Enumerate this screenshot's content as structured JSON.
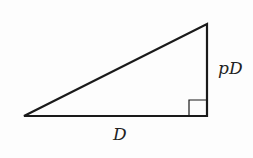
{
  "diagram": {
    "type": "right-triangle",
    "labels": {
      "base": "D",
      "height": "pD"
    },
    "vertices": {
      "left": [
        24,
        116
      ],
      "right_angle": [
        207,
        116
      ],
      "top": [
        207,
        24
      ]
    },
    "right_angle_marker": true,
    "stroke_color": "#1a1a1a",
    "background": "#fdfdfd"
  }
}
